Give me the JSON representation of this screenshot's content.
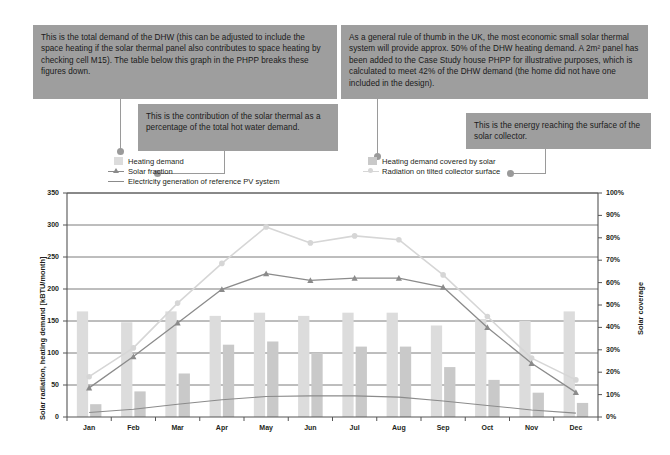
{
  "callouts": [
    {
      "id": "dhw-demand-note",
      "text": "This is the total demand of the DHW (this can be adjusted to include the space heating if the solar thermal panel also contributes to space heating by checking cell M15). The table below this graph in the PHPP breaks these figures down."
    },
    {
      "id": "solar-fraction-note",
      "text": "This is the contribution of the solar thermal as a percentage of the total hot water demand."
    },
    {
      "id": "rule-of-thumb-note",
      "text": "As a general rule of thumb in the UK, the most economic small solar thermal system will provide approx. 50% of the DHW heating demand. A 2m² panel has been added to the Case Study house PHPP for illustrative purposes, which is calculated to meet 42% of the DHW demand (the home did not have one included in the design)."
    },
    {
      "id": "collector-energy-note",
      "text": "This is the energy reaching the surface of the solar collector."
    }
  ],
  "legend": [
    {
      "id": "heating-demand",
      "label": "Heating demand",
      "marker": "bar",
      "color": "#dcdcdc"
    },
    {
      "id": "solar-fraction",
      "label": "Solar fraction",
      "marker": "line-triangle",
      "color": "#8b8b8b"
    },
    {
      "id": "pv-generation",
      "label": "Electricity generation of reference PV system",
      "marker": "line",
      "color": "#8b8b8b"
    },
    {
      "id": "heating-demand-covered",
      "label": "Heating demand covered by solar",
      "marker": "bar",
      "color": "#c9c9c9"
    },
    {
      "id": "radiation-tilted",
      "label": "Radiation on tilted collector surface",
      "marker": "line-dot",
      "color": "#d6d6d6"
    }
  ],
  "colors": {
    "callout_bg": "#9e9e9e",
    "leader": "#9a9a9a",
    "bar_demand": "#dcdcdc",
    "bar_covered": "#c9c9c9",
    "line_solar_fraction": "#8b8b8b",
    "line_radiation": "#d6d6d6",
    "line_pv": "#8b8b8b",
    "grid": "#6e6e6e",
    "text": "#231f20"
  },
  "chart_data": {
    "type": "bar",
    "title": "",
    "categories": [
      "Jan",
      "Feb",
      "Mar",
      "Apr",
      "May",
      "Jun",
      "Jul",
      "Aug",
      "Sep",
      "Oct",
      "Nov",
      "Dec"
    ],
    "xlabel": "",
    "ylabel": "Solar radiation, heating demand [kBTU/month]",
    "ylim": [
      0,
      350
    ],
    "yticks": [
      0,
      50,
      100,
      150,
      200,
      250,
      300,
      350
    ],
    "ytick_labels": [
      "0",
      "50",
      "100",
      "150",
      "200",
      "250",
      "300",
      "350"
    ],
    "y2label": "Solar coverage",
    "y2lim": [
      0,
      100
    ],
    "y2ticks": [
      0,
      10,
      20,
      30,
      40,
      50,
      60,
      70,
      80,
      90,
      100
    ],
    "y2tick_labels": [
      "0%",
      "10%",
      "20%",
      "30%",
      "40%",
      "50%",
      "60%",
      "70%",
      "80%",
      "90%",
      "100%"
    ],
    "grid": true,
    "legend_position": "above",
    "series": [
      {
        "name": "Heating demand",
        "type": "bar",
        "axis": "left",
        "color": "#dcdcdc",
        "values": [
          165,
          148,
          165,
          158,
          163,
          158,
          163,
          163,
          143,
          153,
          150,
          165
        ]
      },
      {
        "name": "Heating demand covered by solar",
        "type": "bar",
        "axis": "left",
        "color": "#c9c9c9",
        "values": [
          20,
          40,
          68,
          113,
          118,
          100,
          110,
          110,
          78,
          58,
          38,
          22
        ]
      },
      {
        "name": "Solar fraction",
        "type": "line",
        "axis": "right",
        "color": "#8b8b8b",
        "marker": "triangle",
        "values": [
          13,
          27,
          42,
          57,
          64,
          61,
          62,
          62,
          58,
          40,
          24,
          11
        ]
      },
      {
        "name": "Radiation on tilted collector surface",
        "type": "line",
        "axis": "left",
        "color": "#d6d6d6",
        "marker": "circle",
        "values": [
          63,
          108,
          178,
          240,
          297,
          272,
          283,
          277,
          222,
          157,
          92,
          58
        ]
      },
      {
        "name": "Electricity generation of reference PV system",
        "type": "line",
        "axis": "left",
        "color": "#8b8b8b",
        "marker": "none",
        "values": [
          7,
          12,
          20,
          27,
          32,
          33,
          33,
          31,
          25,
          18,
          11,
          6
        ]
      }
    ]
  }
}
